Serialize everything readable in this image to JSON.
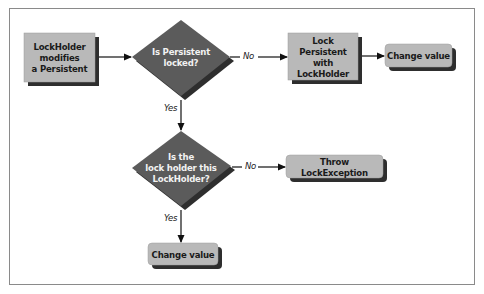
{
  "diagram": {
    "nodes": [
      {
        "id": "start",
        "type": "process",
        "label": "LockHolder\nmodifies\na Persistent"
      },
      {
        "id": "decision1",
        "type": "decision",
        "label": "Is Persistent\nlocked?"
      },
      {
        "id": "lock",
        "type": "process",
        "label": "Lock Persistent\nwith\nLockHolder"
      },
      {
        "id": "change1",
        "type": "terminal",
        "label": "Change value"
      },
      {
        "id": "decision2",
        "type": "decision",
        "label": "Is the\nlock holder this\nLockHolder?"
      },
      {
        "id": "throw",
        "type": "terminal",
        "label": "Throw LockException"
      },
      {
        "id": "change2",
        "type": "terminal",
        "label": "Change value"
      }
    ],
    "edges": [
      {
        "from": "start",
        "to": "decision1",
        "label": ""
      },
      {
        "from": "decision1",
        "to": "lock",
        "label": "No"
      },
      {
        "from": "lock",
        "to": "change1",
        "label": ""
      },
      {
        "from": "decision1",
        "to": "decision2",
        "label": "Yes"
      },
      {
        "from": "decision2",
        "to": "throw",
        "label": "No"
      },
      {
        "from": "decision2",
        "to": "change2",
        "label": "Yes"
      }
    ]
  },
  "colors": {
    "box_fill": "#b9b9b9",
    "diamond_fill": "#5b5b5b",
    "shadow": "#2e2e2e",
    "line": "#111111",
    "frame": "#8a8a8a"
  }
}
